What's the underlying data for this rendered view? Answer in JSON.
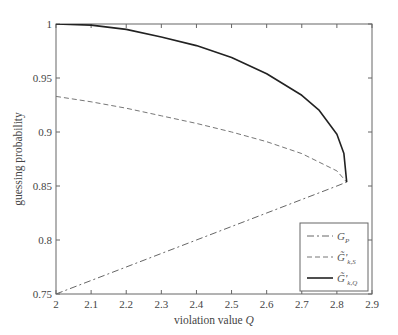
{
  "chart_data": {
    "type": "line",
    "title": "",
    "xlabel": "violation value Q",
    "ylabel": "guessing probability",
    "xlim": [
      2,
      2.9
    ],
    "ylim": [
      0.75,
      1
    ],
    "xticks": [
      "2",
      "2.1",
      "2.2",
      "2.3",
      "2.4",
      "2.5",
      "2.6",
      "2.7",
      "2.8",
      "2.9"
    ],
    "yticks": [
      "0.75",
      "0.8",
      "0.85",
      "0.9",
      "0.95",
      "1"
    ],
    "grid": false,
    "legend_position": "lower right",
    "series": [
      {
        "name": "G_P",
        "style": "dash-dot",
        "x": [
          2.0,
          2.1,
          2.2,
          2.3,
          2.4,
          2.5,
          2.6,
          2.7,
          2.8,
          2.828
        ],
        "y": [
          0.75,
          0.7625,
          0.775,
          0.7875,
          0.8,
          0.8125,
          0.825,
          0.8375,
          0.85,
          0.8536
        ]
      },
      {
        "name": "G̃'k,S",
        "style": "dashed",
        "x": [
          2.0,
          2.1,
          2.2,
          2.3,
          2.4,
          2.5,
          2.6,
          2.7,
          2.8,
          2.828
        ],
        "y": [
          0.933,
          0.928,
          0.922,
          0.915,
          0.908,
          0.9,
          0.891,
          0.88,
          0.864,
          0.8536
        ]
      },
      {
        "name": "G̃'k,Q",
        "style": "solid",
        "x": [
          2.0,
          2.1,
          2.2,
          2.3,
          2.4,
          2.5,
          2.6,
          2.7,
          2.75,
          2.8,
          2.82,
          2.828
        ],
        "y": [
          1.0,
          0.999,
          0.995,
          0.988,
          0.98,
          0.969,
          0.954,
          0.934,
          0.92,
          0.898,
          0.88,
          0.8536
        ]
      }
    ]
  },
  "legend": {
    "gp": "G",
    "gp_sub": "P",
    "gs": "G̃'",
    "gs_sub": "k,S",
    "gq": "G̃'",
    "gq_sub": "k,Q"
  }
}
